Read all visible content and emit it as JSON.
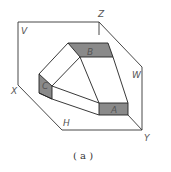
{
  "diagram": {
    "planes": {
      "V": "V",
      "H": "H",
      "W": "W"
    },
    "axes": {
      "X": "X",
      "Y": "Y",
      "Z": "Z"
    },
    "faces": {
      "A": "A",
      "B": "B",
      "C": "C"
    },
    "caption": "( a )",
    "colors": {
      "line": "#222222",
      "face_shade": "#8a8a8a",
      "label": "#555555"
    }
  }
}
